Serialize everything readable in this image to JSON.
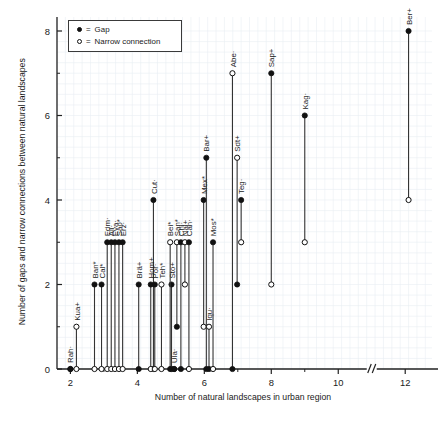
{
  "axes": {
    "xlabel": "Number of natural landscapes in urban region",
    "ylabel": "Number of gaps and narrow connections between\nnatural landscapes",
    "xticks": [
      "2",
      "4",
      "6",
      "8",
      "10",
      "12"
    ],
    "yticks": [
      "0",
      "2",
      "4",
      "6",
      "8"
    ],
    "break_marker": "//"
  },
  "legend": {
    "items": [
      {
        "marker": "filled-circle-icon",
        "eq": "=",
        "label": "Gap"
      },
      {
        "marker": "open-circle-icon",
        "eq": "=",
        "label": "Narrow connection"
      }
    ]
  },
  "chart_data": {
    "type": "scatter",
    "title": "",
    "xlabel": "Number of natural landscapes in urban region",
    "ylabel": "Number of gaps and narrow connections between natural landscapes",
    "xlim": [
      1.6,
      12.8
    ],
    "ylim": [
      0,
      8.45
    ],
    "xticks": [
      2,
      4,
      6,
      8,
      10,
      12
    ],
    "yticks": [
      0,
      2,
      4,
      6,
      8
    ],
    "axis_break": {
      "between": [
        10,
        12
      ],
      "symbol": "//"
    },
    "grid": "minor-light",
    "legend_position": "top-left",
    "series": [
      {
        "name": "Gap",
        "marker": "filled-circle"
      },
      {
        "name": "Narrow connection",
        "marker": "open-circle"
      }
    ],
    "points": [
      {
        "label": "Rah·",
        "x": 2.0,
        "gap": 0,
        "narrow": 0
      },
      {
        "label": "Kua+",
        "x": 2.18,
        "gap": 0,
        "narrow": 1
      },
      {
        "label": "Ban*",
        "x": 2.72,
        "gap": 2,
        "narrow": 0
      },
      {
        "label": "Cal*",
        "x": 2.93,
        "gap": 2,
        "narrow": 0
      },
      {
        "label": "Edm·",
        "x": 3.1,
        "gap": 3,
        "narrow": 0
      },
      {
        "label": "Ali·",
        "x": 3.22,
        "gap": 3,
        "narrow": 0
      },
      {
        "label": "Eva·",
        "x": 3.33,
        "gap": 3,
        "narrow": 0
      },
      {
        "label": "Sao*",
        "x": 3.45,
        "gap": 3,
        "narrow": 0
      },
      {
        "label": "Erz·",
        "x": 3.45,
        "gap": 3,
        "narrow": 0
      },
      {
        "label": "Brä+",
        "x": 4.0,
        "gap": 2,
        "narrow": 0
      },
      {
        "label": "Hom+",
        "x": 4.4,
        "gap": 2,
        "narrow": 0
      },
      {
        "label": "Por·",
        "x": 4.52,
        "gap": 2,
        "narrow": 0
      },
      {
        "label": "Teh*",
        "x": 4.62,
        "gap": 0,
        "narrow": 2
      },
      {
        "label": "Bei*",
        "x": 5.0,
        "gap": 0,
        "narrow": 3
      },
      {
        "label": "San*",
        "x": 5.2,
        "gap": 0,
        "narrow": 3
      },
      {
        "label": "Sto+",
        "x": 5.1,
        "gap": 2,
        "narrow": 0
      },
      {
        "label": "Ula·",
        "x": 5.25,
        "gap": 0,
        "narrow": 0
      },
      {
        "label": "Chi·",
        "x": 5.35,
        "gap": 3,
        "narrow": 0
      },
      {
        "label": "Nai+",
        "x": 5.48,
        "gap": 0,
        "narrow": 3
      },
      {
        "label": "Can·",
        "x": 5.6,
        "gap": 3,
        "narrow": 0
      },
      {
        "label": "Cut·",
        "x": 4.55,
        "gap": 4,
        "narrow": 0
      },
      {
        "label": "Mex*",
        "x": 6.0,
        "gap": 4,
        "narrow": 1
      },
      {
        "label": "Iqu·",
        "x": 6.1,
        "gap": 0,
        "narrow": 1
      },
      {
        "label": "Mos*",
        "x": 6.22,
        "gap": 3,
        "narrow": 0
      },
      {
        "label": "Bar+",
        "x": 6.12,
        "gap": 5,
        "narrow": 0
      },
      {
        "label": "Teg·",
        "x": 6.92,
        "gap": 4,
        "narrow": 2
      },
      {
        "label": "Sdt+",
        "x": 6.98,
        "gap": 2,
        "narrow": 5
      },
      {
        "label": "Abe·",
        "x": 6.88,
        "gap": 0,
        "narrow": 7
      },
      {
        "label": "Sap+",
        "x": 8.0,
        "gap": 7,
        "narrow": 2
      },
      {
        "label": "Kag·",
        "x": 9.0,
        "gap": 6,
        "narrow": 3
      },
      {
        "label": "Ber+",
        "x": 12.1,
        "gap": 8,
        "narrow": 4
      }
    ],
    "stems": [
      {
        "label": "Rah·",
        "x": 2.0,
        "top": 0,
        "top_marker": "filled",
        "bottom": 0,
        "bottom_marker": "filled",
        "label_at": 0
      },
      {
        "label": "Kua+",
        "x": 2.18,
        "top": 1,
        "top_marker": "open",
        "bottom": 0,
        "bottom_marker": "open",
        "label_at": 1
      },
      {
        "label": "Ban*",
        "x": 2.72,
        "top": 2,
        "top_marker": "filled",
        "bottom": 0,
        "bottom_marker": "open",
        "label_at": 2
      },
      {
        "label": "Cal*",
        "x": 2.93,
        "top": 2,
        "top_marker": "filled",
        "bottom": 0,
        "bottom_marker": "open",
        "label_at": 2
      },
      {
        "label": "Edm·",
        "x": 3.1,
        "top": 3,
        "top_marker": "filled",
        "bottom": 0,
        "bottom_marker": "open",
        "label_at": 3
      },
      {
        "label": "Ali·",
        "x": 3.22,
        "top": 3,
        "top_marker": "filled",
        "bottom": 0,
        "bottom_marker": "open",
        "label_at": 3
      },
      {
        "label": "Eva·",
        "x": 3.33,
        "top": 3,
        "top_marker": "filled",
        "bottom": 0,
        "bottom_marker": "open",
        "label_at": 3
      },
      {
        "label": "Sao*",
        "x": 3.45,
        "top": 3,
        "top_marker": "filled",
        "bottom": 0,
        "bottom_marker": "open",
        "label_at": 3
      },
      {
        "label": "Erz·",
        "x": 3.56,
        "top": 3,
        "top_marker": "filled",
        "bottom": 0,
        "bottom_marker": "open",
        "label_at": 3
      },
      {
        "label": "Brä+",
        "x": 4.04,
        "top": 2,
        "top_marker": "filled",
        "bottom": 0,
        "bottom_marker": "filled",
        "label_at": 2
      },
      {
        "label": "Cut·",
        "x": 4.48,
        "top": 4,
        "top_marker": "filled",
        "bottom": 0,
        "bottom_marker": "filled",
        "label_at": 4
      },
      {
        "label": "Hom+",
        "x": 4.4,
        "top": 2,
        "top_marker": "filled",
        "bottom": 0,
        "bottom_marker": "open",
        "label_at": 2
      },
      {
        "label": "Por·",
        "x": 4.52,
        "top": 2,
        "top_marker": "filled",
        "bottom": 0,
        "bottom_marker": "open",
        "label_at": 2
      },
      {
        "label": "Teh*",
        "x": 4.72,
        "top": 2,
        "top_marker": "open",
        "bottom": 0,
        "bottom_marker": "open",
        "label_at": 2
      },
      {
        "label": "Sto+",
        "x": 5.02,
        "top": 2,
        "top_marker": "filled",
        "bottom": 0,
        "bottom_marker": "open",
        "label_at": 2
      },
      {
        "label": "Bei*",
        "x": 4.98,
        "top": 3,
        "top_marker": "open",
        "bottom": 0,
        "bottom_marker": "filled",
        "label_at": 3
      },
      {
        "label": "San*",
        "x": 5.18,
        "top": 3,
        "top_marker": "open",
        "bottom": 1,
        "bottom_marker": "filled",
        "label_at": 3
      },
      {
        "label": "Ula·",
        "x": 5.1,
        "top": 0,
        "top_marker": "filled",
        "bottom": 0,
        "bottom_marker": "filled",
        "label_at": 0
      },
      {
        "label": "Chi·",
        "x": 5.3,
        "top": 3,
        "top_marker": "filled",
        "bottom": 0,
        "bottom_marker": "filled",
        "label_at": 3
      },
      {
        "label": "Nai+",
        "x": 5.42,
        "top": 3,
        "top_marker": "open",
        "bottom": 2,
        "bottom_marker": "open",
        "label_at": 3
      },
      {
        "label": "Can·",
        "x": 5.54,
        "top": 3,
        "top_marker": "filled",
        "bottom": 0,
        "bottom_marker": "open",
        "label_at": 3
      },
      {
        "label": "Mex*",
        "x": 5.98,
        "top": 4,
        "top_marker": "filled",
        "bottom": 1,
        "bottom_marker": "open",
        "label_at": 4
      },
      {
        "label": "Bar+",
        "x": 6.06,
        "top": 5,
        "top_marker": "filled",
        "bottom": 0,
        "bottom_marker": "filled",
        "label_at": 5
      },
      {
        "label": "Iqu·",
        "x": 6.14,
        "top": 1,
        "top_marker": "open",
        "bottom": 0,
        "bottom_marker": "filled",
        "label_at": 1
      },
      {
        "label": "Mos*",
        "x": 6.26,
        "top": 3,
        "top_marker": "filled",
        "bottom": 0,
        "bottom_marker": "open",
        "label_at": 3
      },
      {
        "label": "Abe·",
        "x": 6.84,
        "top": 7,
        "top_marker": "open",
        "bottom": 0,
        "bottom_marker": "filled",
        "label_at": 7
      },
      {
        "label": "Sdt+",
        "x": 6.98,
        "top": 5,
        "top_marker": "open",
        "bottom": 2,
        "bottom_marker": "filled",
        "label_at": 5
      },
      {
        "label": "Teg·",
        "x": 7.1,
        "top": 4,
        "top_marker": "filled",
        "bottom": 3,
        "bottom_marker": "open",
        "label_at": 4
      },
      {
        "label": "Sap+",
        "x": 8.0,
        "top": 7,
        "top_marker": "filled",
        "bottom": 2,
        "bottom_marker": "open",
        "label_at": 7
      },
      {
        "label": "Kag·",
        "x": 9.0,
        "top": 6,
        "top_marker": "filled",
        "bottom": 3,
        "bottom_marker": "open",
        "label_at": 6
      },
      {
        "label": "Ber+",
        "x": 12.1,
        "top": 8,
        "top_marker": "filled",
        "bottom": 4,
        "bottom_marker": "open",
        "label_at": 8
      }
    ]
  }
}
